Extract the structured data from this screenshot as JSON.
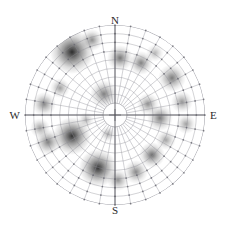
{
  "figure": {
    "title": "",
    "type": "pole-figure",
    "projection": "stereographic",
    "background_color": "#ffffff",
    "grid_color": "#8e8e96",
    "axis_color": "#55555c",
    "node_color": "#6a6a72"
  },
  "cardinals": {
    "north": "N",
    "east": "E",
    "south": "S",
    "west": "W"
  },
  "chart_data": {
    "type": "heatmap",
    "subtype": "polar-density-contour",
    "title": "",
    "xlabel": "",
    "ylabel": "",
    "projection": "stereographic",
    "grid": true,
    "legend": null,
    "center": {
      "x": 115,
      "y": 115
    },
    "outer_radius": 90,
    "inner_blank_radius": 12,
    "ring_count": 9,
    "spoke_count": 36,
    "spoke_step_degrees": 10,
    "azimuth_tick_labels": [
      "N",
      "E",
      "S",
      "W"
    ],
    "colormap": "grayscale",
    "value_range": [
      0,
      1
    ],
    "points": [
      {
        "cx": 72,
        "cy": 52,
        "r": 22,
        "v": 0.96
      },
      {
        "cx": 92,
        "cy": 40,
        "r": 11,
        "v": 0.52
      },
      {
        "cx": 120,
        "cy": 58,
        "r": 13,
        "v": 0.62
      },
      {
        "cx": 141,
        "cy": 63,
        "r": 12,
        "v": 0.58
      },
      {
        "cx": 155,
        "cy": 53,
        "r": 9,
        "v": 0.34
      },
      {
        "cx": 172,
        "cy": 78,
        "r": 14,
        "v": 0.6
      },
      {
        "cx": 182,
        "cy": 102,
        "r": 11,
        "v": 0.48
      },
      {
        "cx": 60,
        "cy": 88,
        "r": 10,
        "v": 0.44
      },
      {
        "cx": 44,
        "cy": 104,
        "r": 12,
        "v": 0.55
      },
      {
        "cx": 104,
        "cy": 94,
        "r": 14,
        "v": 0.58
      },
      {
        "cx": 148,
        "cy": 104,
        "r": 11,
        "v": 0.5
      },
      {
        "cx": 160,
        "cy": 118,
        "r": 13,
        "v": 0.6
      },
      {
        "cx": 186,
        "cy": 124,
        "r": 10,
        "v": 0.42
      },
      {
        "cx": 72,
        "cy": 136,
        "r": 19,
        "v": 0.93
      },
      {
        "cx": 48,
        "cy": 142,
        "r": 13,
        "v": 0.58
      },
      {
        "cx": 40,
        "cy": 128,
        "r": 10,
        "v": 0.44
      },
      {
        "cx": 98,
        "cy": 168,
        "r": 19,
        "v": 0.92
      },
      {
        "cx": 118,
        "cy": 180,
        "r": 11,
        "v": 0.5
      },
      {
        "cx": 136,
        "cy": 172,
        "r": 12,
        "v": 0.54
      },
      {
        "cx": 152,
        "cy": 155,
        "r": 13,
        "v": 0.66
      },
      {
        "cx": 166,
        "cy": 140,
        "r": 10,
        "v": 0.42
      },
      {
        "cx": 108,
        "cy": 134,
        "r": 8,
        "v": 0.36
      },
      {
        "cx": 86,
        "cy": 120,
        "r": 8,
        "v": 0.33
      }
    ]
  }
}
